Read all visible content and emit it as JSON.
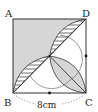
{
  "diagram": {
    "type": "geometry",
    "shape": "square ABCD with quarter-circle arcs and lens regions",
    "vertices": {
      "A": {
        "label": "A",
        "position": "top-left"
      },
      "B": {
        "label": "B",
        "position": "bottom-left"
      },
      "C": {
        "label": "C",
        "position": "bottom-right"
      },
      "D": {
        "label": "D",
        "position": "top-right"
      }
    },
    "dimension": {
      "label": "8cm",
      "side": "BC"
    },
    "midpoint_marks": [
      "midpoint of BC",
      "midpoint of DC"
    ],
    "colors": {
      "stroke": "#333333",
      "gray_fill": "#d6d6d6",
      "hatch": "#333333",
      "background": "#ffffff"
    }
  }
}
